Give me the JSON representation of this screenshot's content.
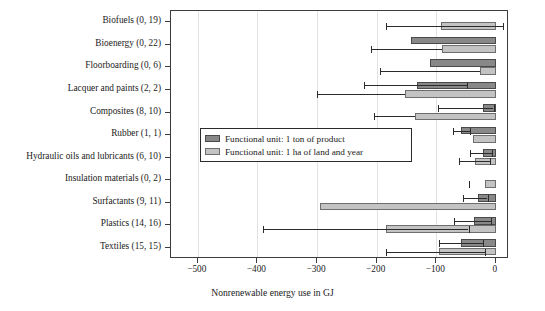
{
  "chart_data": {
    "type": "bar",
    "title": "",
    "xlabel": "Nonrenewable energy use in GJ",
    "ylabel": "",
    "xlim": [
      -545,
      22
    ],
    "xticks": [
      -500,
      -400,
      -300,
      -200,
      -100,
      0
    ],
    "xtick_labels": [
      "−500",
      "−400",
      "−300",
      "−200",
      "−100",
      "0"
    ],
    "grid": true,
    "orientation": "horizontal",
    "legend_position": "center-left",
    "legend": [
      "Functional unit: 1 ton of product",
      "Functional unit: 1 ha of land and year"
    ],
    "categories": [
      "Biofuels (0, 19)",
      "Bioenergy (0, 22)",
      "Floorboarding (0, 6)",
      "Lacquer and paints (2, 2)",
      "Composites (8, 10)",
      "Rubber (1, 1)",
      "Hydraulic oils and lubricants (6, 10)",
      "Insulation materials (0, 2)",
      "Surfactants (9, 11)",
      "Plastics (14, 16)",
      "Textiles (15, 15)"
    ],
    "series": [
      {
        "name": "Functional unit: 1 ton of product",
        "key": "ton",
        "color": "#888888",
        "values": [
          null,
          -143,
          -110,
          -132,
          -22,
          -58,
          -22,
          null,
          -30,
          -36,
          -58
        ],
        "err_low": [
          null,
          null,
          null,
          -222,
          -97,
          -72,
          -43,
          null,
          -55,
          -70,
          -96
        ],
        "err_high": [
          null,
          null,
          null,
          -48,
          -4,
          -44,
          -6,
          null,
          -14,
          -8,
          -22
        ]
      },
      {
        "name": "Functional unit: 1 ha of land and year",
        "key": "ha",
        "color": "#c3c3c3",
        "values": [
          -92,
          -90,
          -27,
          -153,
          -136,
          -38,
          -35,
          -18,
          -295,
          -185,
          -95
        ],
        "err_low": [
          -185,
          -210,
          -195,
          -300,
          -205,
          null,
          -62,
          -45,
          null,
          -390,
          -185
        ],
        "err_high": [
          12,
          null,
          null,
          null,
          null,
          null,
          -10,
          -45,
          null,
          -46,
          -18
        ]
      }
    ]
  },
  "axis": {
    "x_title": "Nonrenewable energy use in GJ"
  }
}
